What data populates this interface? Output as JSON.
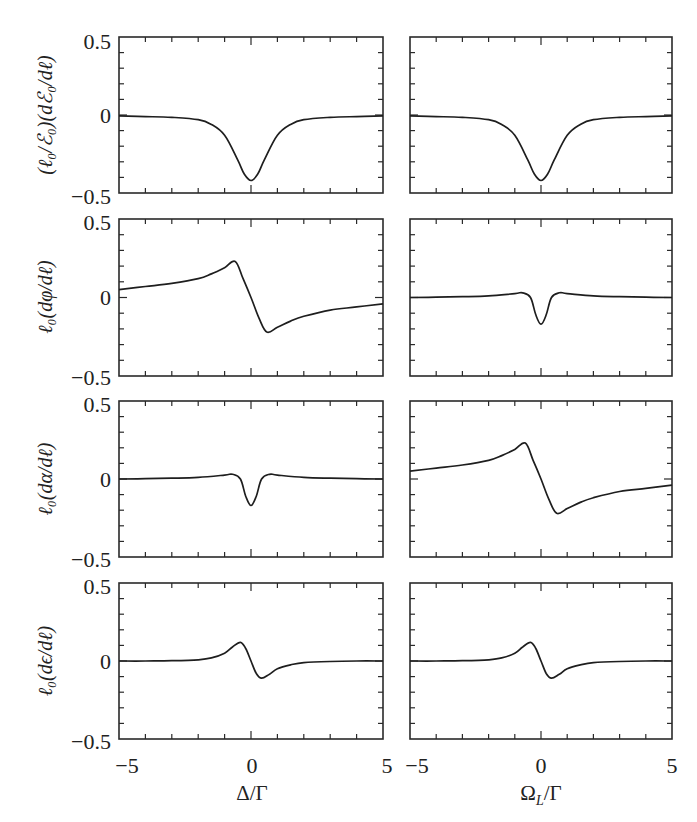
{
  "chart_data": {
    "type": "line",
    "layout": {
      "rows": 4,
      "columns": 2,
      "grid": false,
      "legend": "none"
    },
    "columns": [
      {
        "xlabel": "Δ/Γ",
        "xlim": [
          -5,
          5
        ],
        "xticks": [
          "−5",
          "0",
          "5"
        ]
      },
      {
        "xlabel": "Ω_L/Γ",
        "xlim": [
          -5,
          5
        ],
        "xticks": [
          "−5",
          "0",
          "5"
        ]
      }
    ],
    "rows": [
      {
        "ylabel": "(ℓ0/ℰ0)(dℰ0/dℓ)",
        "ylim": [
          -0.5,
          0.5
        ],
        "yticks": [
          "0.5",
          "0",
          "−0.5"
        ]
      },
      {
        "ylabel": "ℓ0(dφ/dℓ)",
        "ylim": [
          -0.5,
          0.5
        ],
        "yticks": [
          "0.5",
          "0",
          "−0.5"
        ]
      },
      {
        "ylabel": "ℓ0(dα/dℓ)",
        "ylim": [
          -0.5,
          0.5
        ],
        "yticks": [
          "0.5",
          "0",
          "−0.5"
        ]
      },
      {
        "ylabel": "ℓ0(dϵ/dℓ)",
        "ylim": [
          -0.5,
          0.5
        ],
        "yticks": [
          "0.5",
          "0",
          "−0.5"
        ]
      }
    ],
    "panels": [
      {
        "row": 0,
        "col": 0,
        "shape": "lorentzian-dip",
        "x": [
          -5,
          -4,
          -3,
          -2,
          -1.5,
          -1,
          -0.5,
          -0.25,
          0,
          0.25,
          0.5,
          1,
          1.5,
          2,
          3,
          4,
          5
        ],
        "y": [
          -0.005,
          -0.01,
          -0.015,
          -0.03,
          -0.06,
          -0.13,
          -0.29,
          -0.38,
          -0.42,
          -0.38,
          -0.29,
          -0.13,
          -0.06,
          -0.03,
          -0.015,
          -0.01,
          -0.005
        ]
      },
      {
        "row": 0,
        "col": 1,
        "shape": "lorentzian-dip",
        "x": [
          -5,
          -4,
          -3,
          -2,
          -1.5,
          -1,
          -0.5,
          -0.25,
          0,
          0.25,
          0.5,
          1,
          1.5,
          2,
          3,
          4,
          5
        ],
        "y": [
          -0.005,
          -0.01,
          -0.015,
          -0.03,
          -0.06,
          -0.13,
          -0.29,
          -0.38,
          -0.42,
          -0.38,
          -0.29,
          -0.13,
          -0.06,
          -0.03,
          -0.015,
          -0.01,
          -0.005
        ]
      },
      {
        "row": 1,
        "col": 0,
        "shape": "dispersive",
        "x": [
          -5,
          -4,
          -3,
          -2,
          -1.5,
          -1,
          -0.6,
          -0.3,
          0,
          0.3,
          0.6,
          1,
          1.5,
          2,
          3,
          4,
          5
        ],
        "y": [
          0.05,
          0.07,
          0.09,
          0.12,
          0.15,
          0.19,
          0.23,
          0.12,
          0,
          -0.13,
          -0.22,
          -0.19,
          -0.15,
          -0.12,
          -0.08,
          -0.06,
          -0.04
        ]
      },
      {
        "row": 1,
        "col": 1,
        "shape": "dip-with-shoulders",
        "x": [
          -5,
          -4,
          -3,
          -2,
          -1,
          -0.7,
          -0.4,
          -0.2,
          0,
          0.2,
          0.4,
          0.7,
          1,
          2,
          3,
          4,
          5
        ],
        "y": [
          0,
          0.002,
          0.005,
          0.01,
          0.025,
          0.03,
          0,
          -0.11,
          -0.17,
          -0.11,
          0,
          0.03,
          0.025,
          0.01,
          0.005,
          0.002,
          0
        ]
      },
      {
        "row": 2,
        "col": 0,
        "shape": "dip-with-shoulders",
        "x": [
          -5,
          -4,
          -3,
          -2,
          -1,
          -0.7,
          -0.4,
          -0.2,
          0,
          0.2,
          0.4,
          0.7,
          1,
          2,
          3,
          4,
          5
        ],
        "y": [
          0,
          0.002,
          0.005,
          0.01,
          0.025,
          0.03,
          0,
          -0.11,
          -0.17,
          -0.11,
          0,
          0.03,
          0.025,
          0.01,
          0.005,
          0.002,
          0
        ]
      },
      {
        "row": 2,
        "col": 1,
        "shape": "dispersive",
        "x": [
          -5,
          -4,
          -3,
          -2,
          -1.5,
          -1,
          -0.6,
          -0.3,
          0,
          0.3,
          0.6,
          1,
          1.5,
          2,
          3,
          4,
          5
        ],
        "y": [
          0.05,
          0.07,
          0.09,
          0.12,
          0.15,
          0.19,
          0.23,
          0.12,
          0,
          -0.13,
          -0.22,
          -0.19,
          -0.15,
          -0.12,
          -0.08,
          -0.06,
          -0.04
        ]
      },
      {
        "row": 3,
        "col": 0,
        "shape": "small-dispersive",
        "x": [
          -5,
          -4,
          -3,
          -2,
          -1.5,
          -1,
          -0.7,
          -0.4,
          -0.2,
          0,
          0.2,
          0.4,
          0.7,
          1,
          1.5,
          2,
          3,
          4,
          5
        ],
        "y": [
          0,
          0,
          0.002,
          0.008,
          0.02,
          0.05,
          0.09,
          0.12,
          0.08,
          0,
          -0.08,
          -0.11,
          -0.085,
          -0.05,
          -0.025,
          -0.01,
          -0.003,
          0,
          0
        ]
      },
      {
        "row": 3,
        "col": 1,
        "shape": "small-dispersive",
        "x": [
          -5,
          -4,
          -3,
          -2,
          -1.5,
          -1,
          -0.7,
          -0.4,
          -0.2,
          0,
          0.2,
          0.4,
          0.7,
          1,
          1.5,
          2,
          3,
          4,
          5
        ],
        "y": [
          0,
          0,
          0.002,
          0.008,
          0.02,
          0.05,
          0.09,
          0.12,
          0.08,
          0,
          -0.08,
          -0.11,
          -0.085,
          -0.05,
          -0.025,
          -0.01,
          -0.003,
          0,
          0
        ]
      }
    ]
  },
  "labels": {
    "ytick_top": "0.5",
    "ytick_mid": "0",
    "ytick_bottom": "−0.5",
    "xtick_left": "−5",
    "xtick_mid": "0",
    "xtick_right": "5",
    "xlabel_left": "Δ/Γ",
    "xlabel_right_main": "Ω",
    "xlabel_right_sub": "L",
    "xlabel_right_tail": "/Γ",
    "ylabel_row0": "(ℓ₀/ℰ₀)(dℰ₀/dℓ)",
    "ylabel_row1": "ℓ₀(dφ/dℓ)",
    "ylabel_row2": "ℓ₀(dα/dℓ)",
    "ylabel_row3": "ℓ₀(dϵ/dℓ)"
  }
}
